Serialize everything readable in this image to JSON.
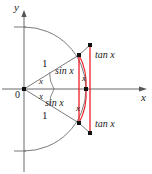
{
  "figure": {
    "colors": {
      "axis": "#555555",
      "construction": "#6b6b6b",
      "highlight": "#ee1c25",
      "text": "#1a1a1a",
      "background": "#ffffff"
    },
    "axes": {
      "y_label": "y",
      "x_label": "x",
      "origin_label": "0"
    },
    "labels": {
      "radius_upper": "1",
      "radius_lower": "1",
      "angle_upper": "x",
      "angle_lower": "x",
      "sin_upper": "sin x",
      "sin_lower": "sin x",
      "arc_upper": "x",
      "arc_lower": "x",
      "tan_upper": "tan x",
      "tan_lower": "tan x"
    },
    "geometry": {
      "origin": [
        24,
        89
      ],
      "radius": 62,
      "angle_degrees": 33,
      "circle_point_upper": [
        79,
        55
      ],
      "circle_point_lower": [
        79,
        123
      ],
      "tangent_foot": [
        86,
        89
      ],
      "tangent_point_upper": [
        90,
        45
      ],
      "tangent_point_lower": [
        90,
        133
      ]
    }
  }
}
